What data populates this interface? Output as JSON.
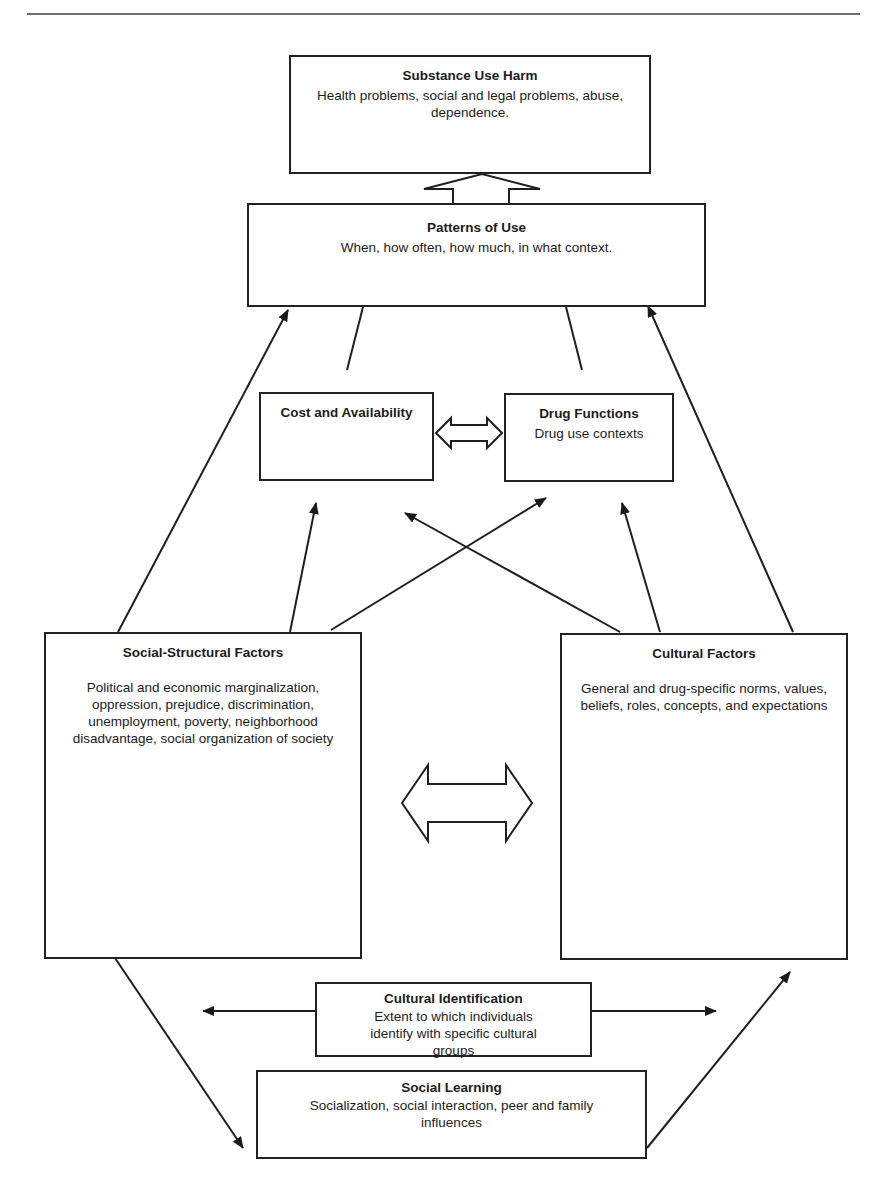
{
  "diagram": {
    "type": "conceptual-model",
    "colors": {
      "stroke": "#222222",
      "background": "#ffffff",
      "rule": "#6e6e6e"
    },
    "nodes": {
      "substance_use_harm": {
        "title": "Substance Use Harm",
        "description": "Health problems, social and legal problems, abuse, dependence."
      },
      "patterns_of_use": {
        "title": "Patterns of Use",
        "description": "When, how often, how much, in what context."
      },
      "cost_availability": {
        "title": "Cost and Availability",
        "description": ""
      },
      "drug_functions": {
        "title": "Drug Functions",
        "description": "Drug use contexts"
      },
      "social_structural": {
        "title": "Social-Structural Factors",
        "description": "Political and economic marginalization, oppression, prejudice, discrimination, unemployment, poverty, neighborhood disadvantage, social organization of society"
      },
      "cultural_factors": {
        "title": "Cultural Factors",
        "description": "General and drug-specific norms, values, beliefs, roles, concepts, and expectations"
      },
      "cultural_identification": {
        "title": "Cultural Identification",
        "description": "Extent to which individuals identify with specific cultural groups"
      },
      "social_learning": {
        "title": "Social Learning",
        "description": "Socialization, social interaction, peer and family influences"
      }
    },
    "edges": [
      {
        "from": "patterns_of_use",
        "to": "substance_use_harm",
        "style": "hollow-arrow"
      },
      {
        "from": "cost_availability",
        "to": "drug_functions",
        "style": "hollow-double-arrow"
      },
      {
        "from": "social_structural",
        "to": "cultural_factors",
        "style": "hollow-double-arrow"
      },
      {
        "from": "cost_availability",
        "to": "patterns_of_use",
        "style": "line"
      },
      {
        "from": "drug_functions",
        "to": "patterns_of_use",
        "style": "line"
      },
      {
        "from": "social_structural",
        "to": "patterns_of_use",
        "style": "arrow"
      },
      {
        "from": "cultural_factors",
        "to": "patterns_of_use",
        "style": "arrow"
      },
      {
        "from": "social_structural",
        "to": "cost_availability",
        "style": "arrow"
      },
      {
        "from": "social_structural",
        "to": "drug_functions",
        "style": "arrow"
      },
      {
        "from": "cultural_factors",
        "to": "cost_availability",
        "style": "arrow"
      },
      {
        "from": "cultural_factors",
        "to": "drug_functions",
        "style": "arrow"
      },
      {
        "from": "cultural_identification",
        "to": "social_structural",
        "style": "arrow"
      },
      {
        "from": "cultural_identification",
        "to": "cultural_factors",
        "style": "arrow"
      },
      {
        "from": "social_structural",
        "to": "social_learning",
        "style": "arrow"
      },
      {
        "from": "social_learning",
        "to": "cultural_factors",
        "style": "arrow"
      }
    ]
  }
}
